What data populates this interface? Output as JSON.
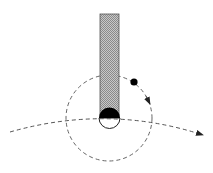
{
  "diagram": {
    "title": "",
    "colors": {
      "background": "#ffffff",
      "stroke": "#555555",
      "rod_fill": "#b0b0b0",
      "black": "#000000"
    },
    "elements": {
      "rod": {
        "label": "hatched vertical rod"
      },
      "tip": {
        "label": "half-filled circular tip"
      },
      "orbit": {
        "label": "dashed circular orbit"
      },
      "trajectory": {
        "label": "dashed curved trajectory with arrow"
      },
      "particle": {
        "label": "small black particle"
      },
      "orbit_arrow": {
        "label": "direction arrow on orbit"
      }
    }
  }
}
